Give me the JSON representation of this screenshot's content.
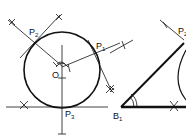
{
  "labels": {
    "p1": {
      "main": "P",
      "sub": "1"
    },
    "p2": {
      "main": "P",
      "sub": "2"
    },
    "p3": {
      "main": "P",
      "sub": "3"
    },
    "o": {
      "main": "O"
    },
    "b1": {
      "main": "B",
      "sub": "1"
    },
    "p2r": {
      "main": "P",
      "sub": "2"
    }
  },
  "colors": {
    "stroke": "#111111",
    "background": "#ffffff"
  }
}
